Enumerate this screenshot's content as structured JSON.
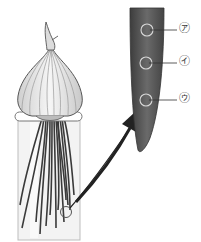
{
  "diagram": {
    "parts": {
      "onion": "onion bulb",
      "container": "glass cylinder with water",
      "roots": "roots",
      "root_tip_marker": "circled region at root tip",
      "magnified_root_tip": "enlarged root tip"
    },
    "labels": [
      {
        "id": "a",
        "text": "㋐"
      },
      {
        "id": "i",
        "text": "㋑"
      },
      {
        "id": "u",
        "text": "㋒"
      }
    ],
    "colors": {
      "root_tip_fill": "#555555",
      "outline": "#333333",
      "onion_fill": "#e8e8e8",
      "glass": "#f2f2f2"
    }
  }
}
